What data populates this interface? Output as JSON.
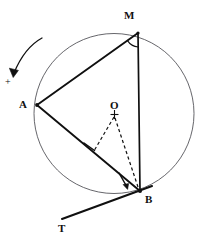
{
  "figure": {
    "background_color": "#ffffff",
    "stroke_color": "#101010",
    "circle_stroke_color": "#55555a",
    "width": 203,
    "height": 240
  },
  "labels": {
    "point_m": "M",
    "point_a": "A",
    "point_o": "O",
    "point_b": "B",
    "point_t": "T",
    "plus_mark": "+"
  },
  "geometry": {
    "circle": {
      "center_x": 114,
      "center_y": 113.5,
      "radius": 80
    },
    "points": {
      "A": {
        "x": 37,
        "y": 105
      },
      "M": {
        "x": 138,
        "y": 33
      },
      "B": {
        "x": 140,
        "y": 191
      },
      "O": {
        "x": 114,
        "y": 114
      },
      "T": {
        "x": 62,
        "y": 219
      },
      "foot_on_AB": {
        "x": 94,
        "y": 151
      },
      "tangent_end": {
        "x": 152,
        "y": 186
      },
      "arrow_tip_at_B": {
        "x": 127,
        "y": 188
      },
      "arrow_tail_at_B": {
        "x": 121,
        "y": 176
      }
    },
    "label_positions": {
      "M": {
        "x": 124,
        "y": 10
      },
      "A": {
        "x": 19,
        "y": 99
      },
      "O": {
        "x": 110,
        "y": 100
      },
      "B": {
        "x": 145,
        "y": 194
      },
      "T": {
        "x": 58,
        "y": 223
      },
      "plus": {
        "x": 5,
        "y": 77
      }
    },
    "segments": [
      {
        "name": "chord-AM",
        "from": "A",
        "to": "M",
        "style": "solid"
      },
      {
        "name": "chord-AB",
        "from": "A",
        "to": "B",
        "style": "solid"
      },
      {
        "name": "chord-MB",
        "from": "M",
        "to": "B",
        "style": "solid"
      },
      {
        "name": "tangent-TB",
        "from": "T",
        "to": "tangent_end",
        "style": "solid"
      },
      {
        "name": "radius-to-foot",
        "from": "O",
        "to": "foot_on_AB",
        "style": "dashed"
      },
      {
        "name": "radius-OB",
        "from": "O",
        "to": "B",
        "style": "dashed"
      },
      {
        "name": "perpendicular-mark",
        "from": "foot_on_AB",
        "to": "O",
        "style": "solid-short"
      }
    ],
    "annotations": {
      "angle_arc_at_M": "inscribed angle AMB",
      "arrow_at_B": "tangent chord angle indicator",
      "curved_arrow_top_left": "direction indicator pointing down-left"
    }
  }
}
